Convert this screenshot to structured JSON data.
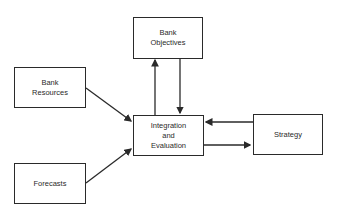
{
  "diagram": {
    "type": "flow",
    "nodes": [
      {
        "id": "objectives",
        "label": "Bank\nObjectives"
      },
      {
        "id": "resources",
        "label": "Bank\nResources"
      },
      {
        "id": "integration",
        "label": "Integration\nand\nEvaluation"
      },
      {
        "id": "strategy",
        "label": "Strategy"
      },
      {
        "id": "forecasts",
        "label": "Forecasts"
      }
    ],
    "edges": [
      {
        "from": "resources",
        "to": "integration"
      },
      {
        "from": "forecasts",
        "to": "integration"
      },
      {
        "from": "integration",
        "to": "objectives"
      },
      {
        "from": "objectives",
        "to": "integration"
      },
      {
        "from": "strategy",
        "to": "integration"
      },
      {
        "from": "integration",
        "to": "strategy"
      }
    ],
    "colors": {
      "line": "#2a2a2a",
      "background": "#ffffff"
    }
  }
}
